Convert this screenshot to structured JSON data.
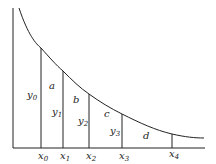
{
  "diagram": {
    "type": "area-under-curve-strips",
    "axis_color": "#222222",
    "curve_color": "#222222",
    "ordinates": [
      {
        "label": "y",
        "sub": "0"
      },
      {
        "label": "y",
        "sub": "1"
      },
      {
        "label": "y",
        "sub": "2"
      },
      {
        "label": "y",
        "sub": "3"
      }
    ],
    "abscissae": [
      {
        "label": "x",
        "sub": "0"
      },
      {
        "label": "x",
        "sub": "1"
      },
      {
        "label": "x",
        "sub": "2"
      },
      {
        "label": "x",
        "sub": "3"
      },
      {
        "label": "x",
        "sub": "4"
      }
    ],
    "regions": [
      "a",
      "b",
      "c",
      "d"
    ]
  }
}
